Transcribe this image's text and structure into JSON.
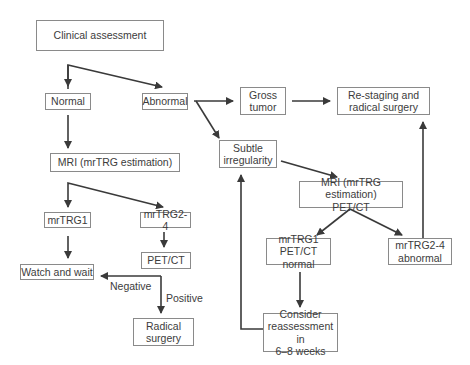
{
  "diagram": {
    "type": "flowchart",
    "nodes": {
      "clinical_assessment": "Clinical assessment",
      "normal": "Normal",
      "abnormal": "Abnormal",
      "mri_left": "MRI (mrTRG estimation)",
      "gross_tumor": "Gross\ntumor",
      "restaging": "Re-staging and\nradical surgery",
      "subtle_irregularity": "Subtle\nirregularity",
      "mri_petct_right": "MRI (mrTRG estimation)\nPET/CT",
      "mrtrg1_left": "mrTRG1",
      "mrtrg24_left": "mrTRG2-4",
      "petct_left": "PET/CT",
      "watch_and_wait": "Watch and wait",
      "radical_surgery": "Radical\nsurgery",
      "mrtrg1_right": "mrTRG1\nPET/CT normal",
      "mrtrg24_right": "mrTRG2-4\nabnormal",
      "reassessment": "Consider\nreassessment in\n6–8 weeks"
    },
    "edge_labels": {
      "negative": "Negative",
      "positive": "Positive"
    },
    "edges": [
      {
        "from": "Clinical assessment",
        "to": "Normal"
      },
      {
        "from": "Clinical assessment",
        "to": "Abnormal"
      },
      {
        "from": "Normal",
        "to": "MRI (mrTRG estimation)"
      },
      {
        "from": "Abnormal",
        "to": "Gross tumor"
      },
      {
        "from": "Abnormal",
        "to": "Subtle irregularity"
      },
      {
        "from": "Gross tumor",
        "to": "Re-staging and radical surgery"
      },
      {
        "from": "Subtle irregularity",
        "to": "MRI (mrTRG estimation) PET/CT"
      },
      {
        "from": "MRI (mrTRG estimation)",
        "to": "mrTRG1"
      },
      {
        "from": "MRI (mrTRG estimation)",
        "to": "mrTRG2-4"
      },
      {
        "from": "mrTRG1",
        "to": "Watch and wait"
      },
      {
        "from": "mrTRG2-4",
        "to": "PET/CT"
      },
      {
        "from": "PET/CT",
        "to": "Watch and wait",
        "label": "Negative"
      },
      {
        "from": "PET/CT",
        "to": "Radical surgery",
        "label": "Positive"
      },
      {
        "from": "MRI (mrTRG estimation) PET/CT",
        "to": "mrTRG1 PET/CT normal"
      },
      {
        "from": "MRI (mrTRG estimation) PET/CT",
        "to": "mrTRG2-4 abnormal"
      },
      {
        "from": "mrTRG1 PET/CT normal",
        "to": "Consider reassessment in 6-8 weeks"
      },
      {
        "from": "Consider reassessment in 6-8 weeks",
        "to": "Subtle irregularity"
      },
      {
        "from": "mrTRG2-4 abnormal",
        "to": "Re-staging and radical surgery"
      }
    ],
    "colors": {
      "stroke": "#3a3a3a",
      "box_border": "#8a8a8a",
      "text": "#3c3c3c"
    }
  }
}
